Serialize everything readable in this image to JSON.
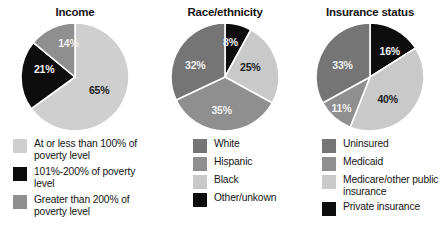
{
  "figure": {
    "background": "#ffffff",
    "palette": {
      "very_light_gray": "#cfcfcf",
      "light_gray": "#c9c9c9",
      "medium_gray": "#8f8f8f",
      "dark_gray": "#757575",
      "black": "#0d0d0d",
      "slice_divider": "#ffffff"
    }
  },
  "chart_data": [
    {
      "type": "pie",
      "title": "Income",
      "xlabel": "",
      "ylabel": "",
      "legend_position": "bottom",
      "start_angle_deg": 0,
      "direction": "clockwise",
      "categories": [
        "At or less than 100% of poverty level",
        "101%-200% of poverty level",
        "Greater than 200% of poverty level"
      ],
      "values": [
        65,
        21,
        14
      ],
      "value_labels": [
        "65%",
        "21%",
        "14%"
      ],
      "colors": [
        "#cfcfcf",
        "#0d0d0d",
        "#8f8f8f"
      ],
      "label_colors": [
        "dark",
        "light",
        "light"
      ],
      "legend": [
        {
          "label": "At or less than 100% of poverty level",
          "color": "#cfcfcf"
        },
        {
          "label": "101%-200% of poverty level",
          "color": "#0d0d0d"
        },
        {
          "label": "Greater than 200% of poverty level",
          "color": "#8f8f8f"
        }
      ]
    },
    {
      "type": "pie",
      "title": "Race/ethnicity",
      "xlabel": "",
      "ylabel": "",
      "legend_position": "bottom",
      "start_angle_deg": 0,
      "direction": "clockwise",
      "categories": [
        "Other/unkown",
        "Black",
        "Hispanic",
        "White"
      ],
      "values": [
        8,
        25,
        35,
        32
      ],
      "value_labels": [
        "8%",
        "25%",
        "35%",
        "32%"
      ],
      "colors": [
        "#0d0d0d",
        "#c9c9c9",
        "#8f8f8f",
        "#757575"
      ],
      "label_colors": [
        "light",
        "dark",
        "light",
        "light"
      ],
      "legend": [
        {
          "label": "White",
          "color": "#757575"
        },
        {
          "label": "Hispanic",
          "color": "#8f8f8f"
        },
        {
          "label": "Black",
          "color": "#c9c9c9"
        },
        {
          "label": "Other/unkown",
          "color": "#0d0d0d"
        }
      ]
    },
    {
      "type": "pie",
      "title": "Insurance status",
      "xlabel": "",
      "ylabel": "",
      "legend_position": "bottom",
      "start_angle_deg": 0,
      "direction": "clockwise",
      "categories": [
        "Private insurance",
        "Medicare/other public insurance",
        "Medicaid",
        "Uninsured"
      ],
      "values": [
        16,
        40,
        11,
        33
      ],
      "value_labels": [
        "16%",
        "40%",
        "11%",
        "33%"
      ],
      "colors": [
        "#0d0d0d",
        "#c9c9c9",
        "#8f8f8f",
        "#757575"
      ],
      "label_colors": [
        "light",
        "dark",
        "light",
        "light"
      ],
      "legend": [
        {
          "label": "Uninsured",
          "color": "#757575"
        },
        {
          "label": "Medicaid",
          "color": "#8f8f8f"
        },
        {
          "label": "Medicare/other public insurance",
          "color": "#c9c9c9"
        },
        {
          "label": "Private insurance",
          "color": "#0d0d0d"
        }
      ]
    }
  ]
}
